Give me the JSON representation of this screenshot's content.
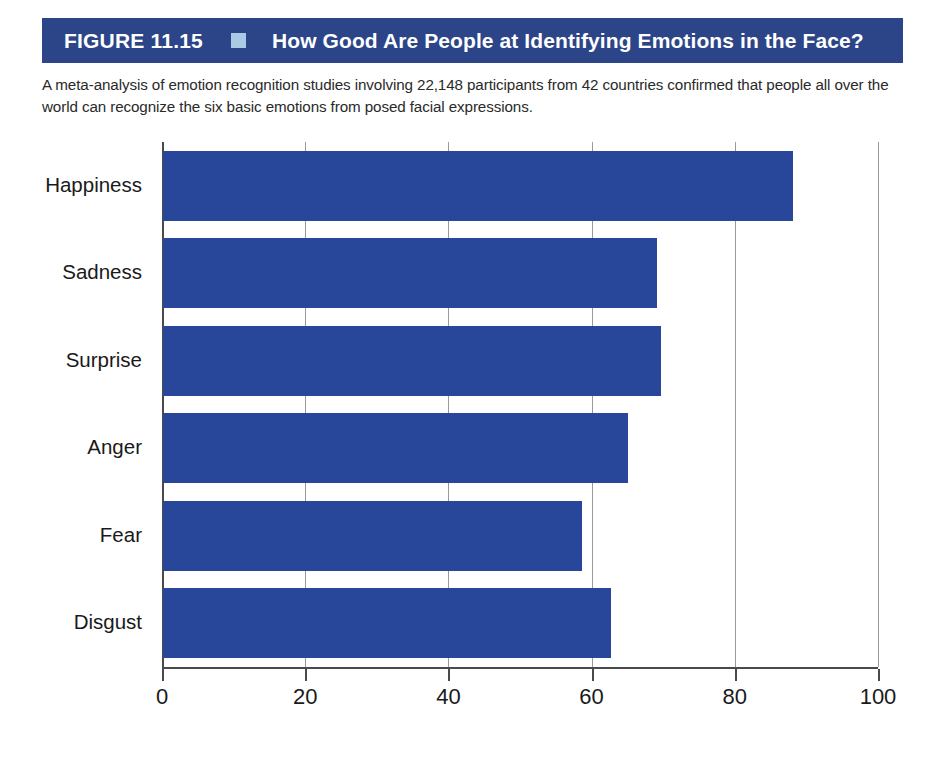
{
  "header": {
    "figure_number": "FIGURE 11.15",
    "bullet_icon": "square-bullet-icon",
    "title": "How Good Are People at Identifying Emotions in the Face?",
    "banner_color": "#2b4588",
    "bullet_color": "#a9c9e4"
  },
  "caption": "A meta-analysis of emotion recognition studies involving 22,148 participants from 42 countries confirmed that people all over the world can recognize the six basic emotions from posed facial expressions.",
  "chart_data": {
    "type": "bar",
    "orientation": "horizontal",
    "title": "How Good Are People at Identifying Emotions in the Face?",
    "categories": [
      "Happiness",
      "Sadness",
      "Surprise",
      "Anger",
      "Fear",
      "Disgust"
    ],
    "values": [
      88,
      69,
      69.5,
      65,
      58.5,
      62.5
    ],
    "xlabel": "Overall Accuracy Percentages",
    "ylabel": "",
    "xlim": [
      0,
      100
    ],
    "xticks": [
      0,
      20,
      40,
      60,
      80,
      100
    ],
    "xtick_labels": [
      "0",
      "20",
      "40",
      "60",
      "80",
      "100"
    ],
    "grid": true,
    "grid_axis": "x",
    "legend": false,
    "bar_color": "#28479a",
    "series": [
      {
        "name": "Overall Accuracy Percentages",
        "values": [
          88,
          69,
          69.5,
          65,
          58.5,
          62.5
        ]
      }
    ]
  }
}
